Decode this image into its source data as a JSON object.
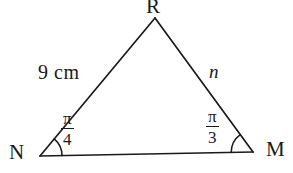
{
  "figure": {
    "type": "triangle-diagram",
    "background_color": "#ffffff",
    "stroke_color": "#1a1a1a",
    "vertices": {
      "apex": "R",
      "left": "N",
      "right": "M"
    },
    "sides": {
      "left_label": "9 cm",
      "right_label": "n",
      "base_label": ""
    },
    "angles": {
      "at_N": {
        "numerator": "π",
        "denominator": "4"
      },
      "at_M": {
        "numerator": "π",
        "denominator": "3"
      }
    },
    "geometry": {
      "apex_x": 155,
      "apex_y": 18,
      "left_x": 40,
      "left_y": 156,
      "right_x": 253,
      "right_y": 152,
      "arc_N_radius": 22,
      "arc_M_radius": 22
    }
  }
}
